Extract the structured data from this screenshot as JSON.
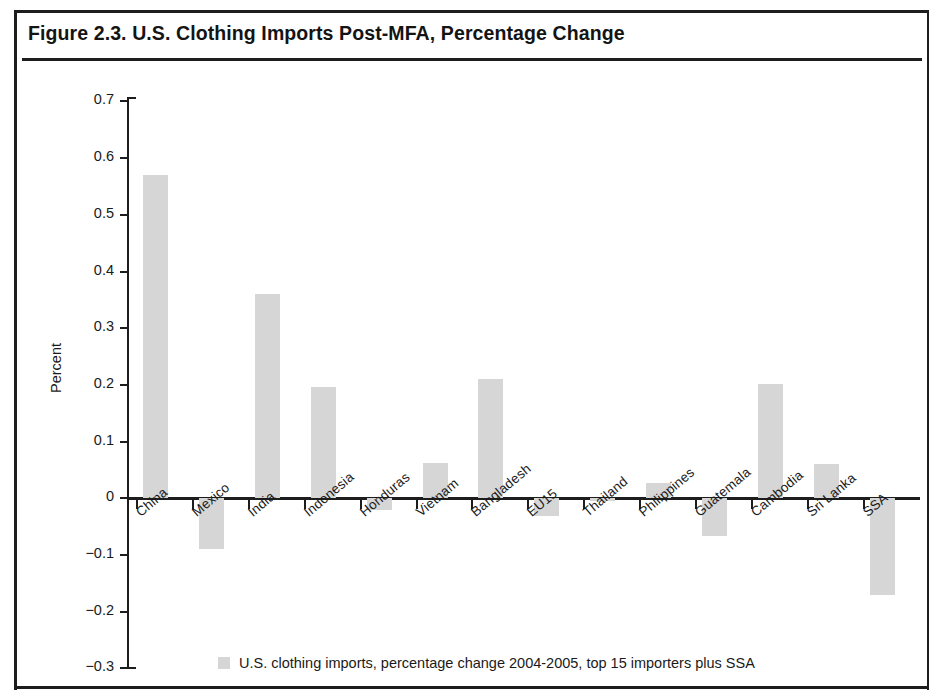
{
  "figure": {
    "title": "Figure 2.3. U.S. Clothing Imports Post-MFA, Percentage Change"
  },
  "chart_data": {
    "type": "bar",
    "title": "Figure 2.3. U.S. Clothing Imports Post-MFA, Percentage Change",
    "xlabel": "",
    "ylabel": "Percent",
    "ylim": [
      -0.3,
      0.7
    ],
    "ytick_values": [
      0.7,
      0.6,
      0.5,
      0.4,
      0.3,
      0.2,
      0.1,
      0,
      -0.1,
      -0.2,
      -0.3
    ],
    "ytick_labels": [
      "0.7",
      "0.6",
      "0.5",
      "0.4",
      "0.3",
      "0.2",
      "0.1",
      "0",
      "−0.1",
      "−0.2",
      "−0.3"
    ],
    "grid": false,
    "legend_position": "bottom",
    "bar_color": "#d6d6d6",
    "axis_color": "#1d1d1d",
    "categories": [
      "China",
      "Mexico",
      "India",
      "Indonesia",
      "Honduras",
      "Vietnam",
      "Bangladesh",
      "EU15",
      "Thailand",
      "Philippines",
      "Guatemala",
      "Cambodia",
      "Sri Lanka",
      "SSA"
    ],
    "series": [
      {
        "name": "U.S. clothing imports, percentage change 2004-2005, top 15 importers plus SSA",
        "values": [
          0.57,
          -0.09,
          0.36,
          0.197,
          -0.02,
          0.063,
          0.21,
          -0.032,
          -0.005,
          0.027,
          -0.066,
          0.202,
          0.06,
          -0.17
        ]
      }
    ]
  },
  "legend": {
    "items": [
      {
        "swatch_color": "#d6d6d6",
        "label": "U.S. clothing imports, percentage change 2004-2005, top 15 importers plus SSA"
      }
    ]
  }
}
